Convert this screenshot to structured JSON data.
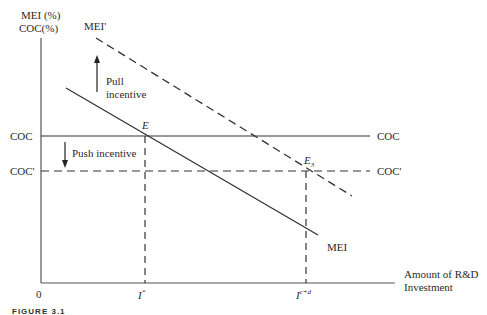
{
  "diagram": {
    "y_axis_label_line1": "MEI (%)",
    "y_axis_label_line2": "COC(%)",
    "x_axis_label_line1": "Amount of R&D",
    "x_axis_label_line2": "Investment",
    "origin_label": "0",
    "curves": {
      "mei_shifted_label": "MEI'",
      "mei_label": "MEI",
      "coc_left_label": "COC",
      "coc_right_label": "COC",
      "coc_shifted_left_label": "COC'",
      "coc_shifted_right_label": "COC'"
    },
    "points": {
      "e_label": "E",
      "e3_label": "E",
      "e3_subscript": "3"
    },
    "x_ticks": {
      "i_star": "I",
      "i_star_sup": "*",
      "i_cd": "I",
      "i_cd_sup": "c+d"
    },
    "annotations": {
      "pull_line1": "Pull",
      "pull_line2": "incentive",
      "push": "Push incentive"
    },
    "caption": "FIGURE 3.1"
  }
}
